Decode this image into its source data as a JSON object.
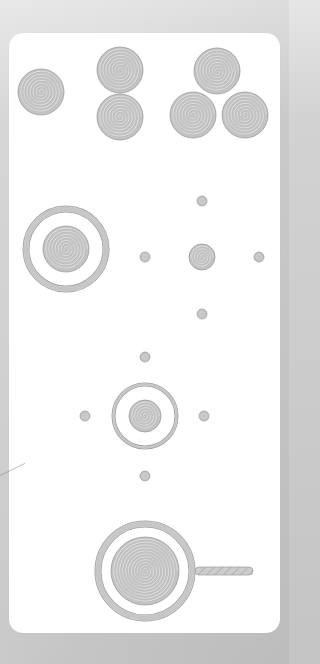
{
  "page": {
    "width": 289,
    "height": 664,
    "background_color": "#cbcbcb",
    "card_color": "#ffffff",
    "card": {
      "x": 9,
      "y": 33,
      "width": 271,
      "height": 600,
      "radius": 14
    }
  },
  "colors": {
    "disk_fill": "#c4c4c4",
    "disk_stroke": "#9a9a9a",
    "spiral_line": "#a9a9a9",
    "ring_fill": "#cfcfcf",
    "ring_stroke": "#a3a3a3",
    "handle_fill": "#c9c9c9"
  },
  "pieces": {
    "single_disk": {
      "icon": "spiral-disk-icon",
      "cx": 41,
      "cy": 92,
      "r": 23
    },
    "stack_of_two": [
      {
        "icon": "spiral-disk-icon",
        "cx": 120,
        "cy": 70,
        "r": 23
      },
      {
        "icon": "spiral-disk-icon",
        "cx": 120,
        "cy": 117,
        "r": 23
      }
    ],
    "group_of_three": [
      {
        "icon": "spiral-disk-icon",
        "cx": 217,
        "cy": 71,
        "r": 23
      },
      {
        "icon": "spiral-disk-icon",
        "cx": 193,
        "cy": 115,
        "r": 23
      },
      {
        "icon": "spiral-disk-icon",
        "cx": 245,
        "cy": 115,
        "r": 23
      }
    ],
    "large_target": {
      "icon": "ringed-target-icon",
      "cx": 66,
      "cy": 249,
      "ring_r": 43,
      "ring_width": 6,
      "inner_r": 23
    },
    "crosshair": {
      "center": {
        "icon": "spiral-disk-icon",
        "cx": 202,
        "cy": 257,
        "r": 13
      },
      "dots": [
        {
          "icon": "dot-icon",
          "cx": 202,
          "cy": 201,
          "r": 5
        },
        {
          "icon": "dot-icon",
          "cx": 145,
          "cy": 257,
          "r": 5
        },
        {
          "icon": "dot-icon",
          "cx": 259,
          "cy": 257,
          "r": 5
        },
        {
          "icon": "dot-icon",
          "cx": 202,
          "cy": 314,
          "r": 5
        }
      ]
    },
    "small_target": {
      "icon": "ringed-target-icon",
      "cx": 145,
      "cy": 416,
      "ring_r": 33,
      "ring_width": 3,
      "inner_r": 16,
      "dots": [
        {
          "icon": "dot-icon",
          "cx": 145,
          "cy": 357,
          "r": 5
        },
        {
          "icon": "dot-icon",
          "cx": 85,
          "cy": 416,
          "r": 5
        },
        {
          "icon": "dot-icon",
          "cx": 204,
          "cy": 416,
          "r": 5
        },
        {
          "icon": "dot-icon",
          "cx": 145,
          "cy": 476,
          "r": 5
        }
      ]
    },
    "magnifier": {
      "icon": "magnifier-icon",
      "cx": 145,
      "cy": 571,
      "ring_r": 50,
      "ring_width": 6,
      "inner_r": 34,
      "handle": {
        "x1": 195,
        "x2": 253,
        "y": 571,
        "thickness": 8
      }
    }
  }
}
